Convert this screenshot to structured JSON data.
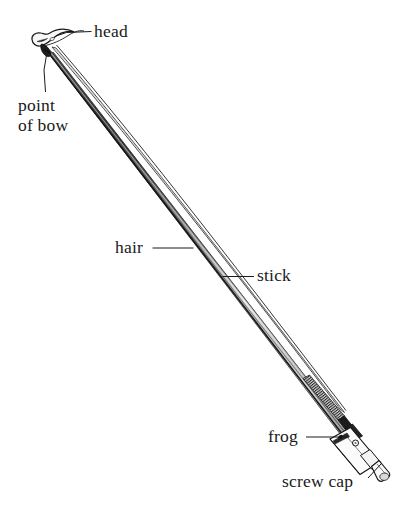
{
  "figure": {
    "orientation": "diagonal, head at upper-left, frog at lower-right",
    "background_color": "#ffffff",
    "line_color": "#1a1a1a",
    "stick_shading_dark": "#4a4a4a",
    "stick_shading_light": "#e8e8e8",
    "frog_fill": "#2b2b2b",
    "winding_fill": "#555555"
  },
  "labels": {
    "head": "head",
    "point_of_bow_line1": "point",
    "point_of_bow_line2": "of bow",
    "hair": "hair",
    "stick": "stick",
    "frog": "frog",
    "screw_cap": "screw cap"
  },
  "parts": [
    {
      "name": "head",
      "label": "head"
    },
    {
      "name": "point-of-bow",
      "label": "point of bow"
    },
    {
      "name": "hair",
      "label": "hair"
    },
    {
      "name": "stick",
      "label": "stick"
    },
    {
      "name": "frog",
      "label": "frog"
    },
    {
      "name": "screw-cap",
      "label": "screw cap"
    }
  ]
}
